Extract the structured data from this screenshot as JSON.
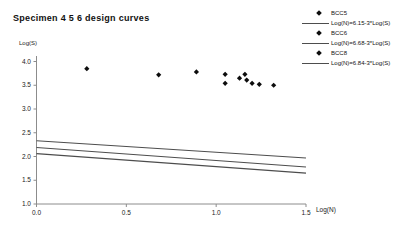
{
  "window": {
    "background": "#ffffff"
  },
  "chart_data": {
    "type": "scatter",
    "title": "Specimen 4 5 6 design curves",
    "xlabel": "Log(N)",
    "ylabel": "Log(S)",
    "xlim": [
      0,
      1.5
    ],
    "ylim": [
      1.0,
      4.0
    ],
    "xticks": [
      "0.0",
      "0.5",
      "1.0",
      "1.5"
    ],
    "yticks": [
      "4.0",
      "3.5",
      "3.0",
      "2.5",
      "2.0",
      "1.5",
      "1.0"
    ],
    "grid": false,
    "legend_position": "top-right",
    "marker": "diamond",
    "marker_color": "#0d0d0d",
    "line_color": "#4d4d4d",
    "axis_color": "#8c8c8c",
    "tick_label_color": "#222222",
    "points": [
      [
        0.28,
        3.85
      ],
      [
        0.68,
        3.72
      ],
      [
        0.89,
        3.78
      ],
      [
        1.05,
        3.73
      ],
      [
        1.05,
        3.54
      ],
      [
        1.13,
        3.65
      ],
      [
        1.16,
        3.73
      ],
      [
        1.17,
        3.61
      ],
      [
        1.2,
        3.54
      ],
      [
        1.24,
        3.52
      ],
      [
        1.32,
        3.5
      ]
    ],
    "lines": [
      {
        "label": "Log(N)=6.15-3*Log(S)",
        "x": [
          0,
          1.5
        ],
        "y": [
          2.06,
          1.65
        ]
      },
      {
        "label": "Log(N)=6.68-3*Log(S)",
        "x": [
          0,
          1.5
        ],
        "y": [
          2.19,
          1.78
        ]
      },
      {
        "label": "Log(N)=6.84-3*Log(S)",
        "x": [
          0,
          1.5
        ],
        "y": [
          2.33,
          1.97
        ]
      }
    ],
    "legend": [
      {
        "type": "marker",
        "label": "BCC5"
      },
      {
        "type": "line",
        "label": "Log(N)=6.15-3*Log(S)"
      },
      {
        "type": "marker",
        "label": "BCC6"
      },
      {
        "type": "line",
        "label": "Log(N)=6.68-3*Log(S)"
      },
      {
        "type": "marker",
        "label": "BCC8"
      },
      {
        "type": "line",
        "label": "Log(N)=6.84-3*Log(S)"
      }
    ]
  }
}
